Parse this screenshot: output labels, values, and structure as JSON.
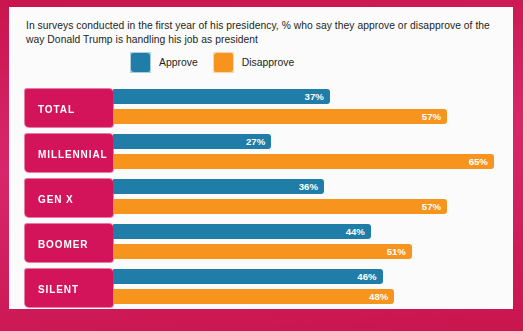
{
  "headline": "In surveys conducted in the first year of his presidency, % who say they approve or disapprove of the way Donald Trump is handling his job as president",
  "legend": {
    "items": [
      {
        "label": "Approve",
        "color": "#1f7da8",
        "swatch_icon": "approve-swatch-icon"
      },
      {
        "label": "Disapprove",
        "color": "#f7941e",
        "swatch_icon": "disapprove-swatch-icon"
      }
    ]
  },
  "colors": {
    "approve": "#1f7da8",
    "disapprove": "#f7941e",
    "category_box": "#d4145a",
    "frame": "#c9154e",
    "panel_background": "#fbfbfb",
    "text": "#231f20"
  },
  "chart_data": {
    "type": "bar",
    "orientation": "horizontal",
    "title": "In surveys conducted in the first year of his presidency, % who say they approve or disapprove of the way Donald Trump is handling his job as president",
    "xlabel": "",
    "ylabel": "",
    "xlim": [
      0,
      100
    ],
    "grid": false,
    "legend_position": "top-center",
    "categories": [
      "TOTAL",
      "MILLENNIAL",
      "GEN X",
      "BOOMER",
      "SILENT"
    ],
    "series": [
      {
        "name": "Approve",
        "color": "#1f7da8",
        "values": [
          37,
          27,
          36,
          44,
          46
        ]
      },
      {
        "name": "Disapprove",
        "color": "#f7941e",
        "values": [
          57,
          65,
          57,
          51,
          48
        ]
      }
    ],
    "value_labels": [
      {
        "category": "TOTAL",
        "approve": "37%",
        "disapprove": "57%"
      },
      {
        "category": "MILLENNIAL",
        "approve": "27%",
        "disapprove": "65%"
      },
      {
        "category": "GEN X",
        "approve": "36%",
        "disapprove": "57%"
      },
      {
        "category": "BOOMER",
        "approve": "44%",
        "disapprove": "51%"
      },
      {
        "category": "SILENT",
        "approve": "46%",
        "disapprove": "48%"
      }
    ]
  },
  "rows": [
    {
      "label": "TOTAL",
      "approve": 37,
      "disapprove": 57,
      "approve_label": "37%",
      "disapprove_label": "57%"
    },
    {
      "label": "MILLENNIAL",
      "approve": 27,
      "disapprove": 65,
      "approve_label": "27%",
      "disapprove_label": "65%"
    },
    {
      "label": "GEN X",
      "approve": 36,
      "disapprove": 57,
      "approve_label": "36%",
      "disapprove_label": "57%"
    },
    {
      "label": "BOOMER",
      "approve": 44,
      "disapprove": 51,
      "approve_label": "44%",
      "disapprove_label": "51%"
    },
    {
      "label": "SILENT",
      "approve": 46,
      "disapprove": 48,
      "approve_label": "48%",
      "disapprove_label": "48%"
    }
  ]
}
